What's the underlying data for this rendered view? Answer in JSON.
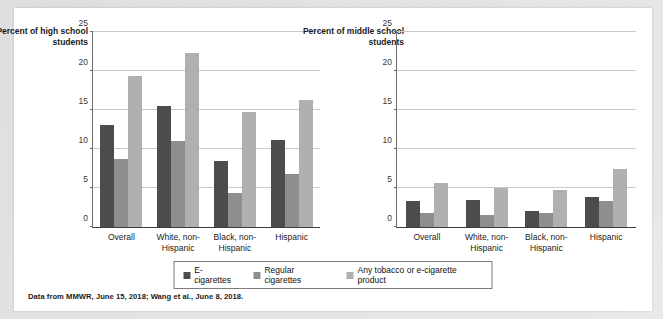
{
  "figure": {
    "source_note": "Data from MMWR, June 15, 2018; Wang et al., June 8, 2018.",
    "colors": {
      "series_0": "#4c4c4c",
      "series_1": "#8e8e8e",
      "series_2": "#b0b0b0",
      "gridline": "#c9c9c9",
      "axis": "#3c3c3c",
      "panel_background": "#ffffff",
      "page_background": "#e8e8e8"
    },
    "legend": {
      "position": "bottom-center",
      "items": [
        {
          "label": "E-cigarettes",
          "color": "#4c4c4c"
        },
        {
          "label": "Regular cigarettes",
          "color": "#8e8e8e"
        },
        {
          "label": "Any tobacco or e-cigarette product",
          "color": "#b0b0b0"
        }
      ]
    }
  },
  "chart_data": [
    {
      "id": "high-school",
      "type": "bar",
      "title": "",
      "ylabel": "Percent of high school students",
      "xlabel": "",
      "ylim": [
        0,
        25
      ],
      "yticks": [
        0,
        5,
        10,
        15,
        20,
        25
      ],
      "grid": true,
      "legend": "bottom",
      "categories": [
        "Overall",
        "White, non-\nHispanic",
        "Black, non-\nHispanic",
        "Hispanic"
      ],
      "series": [
        {
          "name": "E-cigarettes",
          "values": [
            13.1,
            15.5,
            8.4,
            11.2
          ]
        },
        {
          "name": "Regular cigarettes",
          "values": [
            8.7,
            11.0,
            4.3,
            6.8
          ]
        },
        {
          "name": "Any tobacco or e-cigarette product",
          "values": [
            19.4,
            22.3,
            14.8,
            16.3
          ]
        }
      ]
    },
    {
      "id": "middle-school",
      "type": "bar",
      "title": "",
      "ylabel": "Percent of middle school students",
      "xlabel": "",
      "ylim": [
        0,
        25
      ],
      "yticks": [
        0,
        5,
        10,
        15,
        20,
        25
      ],
      "grid": true,
      "legend": "bottom",
      "categories": [
        "Overall",
        "White, non-\nHispanic",
        "Black, non-\nHispanic",
        "Hispanic"
      ],
      "series": [
        {
          "name": "E-cigarettes",
          "values": [
            3.3,
            3.4,
            2.0,
            3.9
          ]
        },
        {
          "name": "Regular cigarettes",
          "values": [
            1.8,
            1.5,
            1.8,
            3.3
          ]
        },
        {
          "name": "Any tobacco or e-cigarette product",
          "values": [
            5.6,
            5.0,
            4.8,
            7.5
          ]
        }
      ]
    }
  ]
}
